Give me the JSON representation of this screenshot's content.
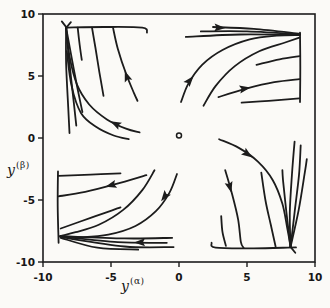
{
  "colors": {
    "ink": "#1c1c1c",
    "background": "#fbfaf7"
  },
  "axis_labels": {
    "x_base": "y",
    "x_sup": "(α)",
    "y_base": "y",
    "y_sup": "(β)"
  },
  "chart_data": {
    "type": "line",
    "subtype": "phase-portrait",
    "title": "",
    "xlabel": "y^(α)",
    "ylabel": "y^(β)",
    "xlabel_base": "y",
    "xlabel_sup": "(α)",
    "ylabel_base": "y",
    "ylabel_sup": "(β)",
    "xlim": [
      -10,
      10
    ],
    "ylim": [
      -10,
      10
    ],
    "grid": false,
    "x_ticks": [
      -10,
      -5,
      0,
      5,
      10
    ],
    "y_ticks": [
      10,
      5,
      0,
      -5,
      -10
    ],
    "x_tick_labels": [
      "-10",
      "-5",
      "0",
      "5",
      "10"
    ],
    "y_tick_labels": [
      "10",
      "5",
      "0",
      "-5",
      "-10"
    ],
    "equilibrium_marker": {
      "x": 0,
      "y": 0.2,
      "symbol": "open-circle"
    },
    "attractors": [
      [
        -8.3,
        8.9
      ],
      [
        8.9,
        8.3
      ],
      [
        -8.75,
        -7.9
      ],
      [
        8.2,
        -8.8
      ]
    ],
    "series": [
      {
        "name": "tl-top-line",
        "points": [
          [
            -8.3,
            8.9
          ],
          [
            -5.5,
            8.95
          ],
          [
            -2.7,
            8.9
          ],
          [
            -2.35,
            8.5
          ]
        ]
      },
      {
        "name": "tl-vertical-1",
        "points": [
          [
            -8.3,
            8.9
          ],
          [
            -8.3,
            6.0
          ],
          [
            -8.15,
            2.5
          ],
          [
            -8.05,
            0.4
          ]
        ]
      },
      {
        "name": "tl-vertical-2",
        "points": [
          [
            -8.3,
            8.9
          ],
          [
            -8.1,
            6.5
          ],
          [
            -7.8,
            3.5
          ],
          [
            -7.55,
            1.0
          ]
        ]
      },
      {
        "name": "tl-vertical-3",
        "points": [
          [
            -8.3,
            8.9
          ],
          [
            -7.95,
            6.8
          ],
          [
            -7.5,
            4.2
          ],
          [
            -7.1,
            2.1
          ]
        ]
      },
      {
        "name": "tl-sweep",
        "points": [
          [
            -8.3,
            8.9
          ],
          [
            -8.05,
            6.6
          ],
          [
            -7.5,
            4.3
          ],
          [
            -6.6,
            2.7
          ],
          [
            -5.3,
            1.5
          ],
          [
            -3.9,
            0.75
          ],
          [
            -2.9,
            0.45
          ]
        ]
      },
      {
        "name": "tl-sweep-low",
        "points": [
          [
            -8.25,
            7.0
          ],
          [
            -7.9,
            4.2
          ],
          [
            -7.2,
            2.0
          ],
          [
            -6.1,
            0.9
          ],
          [
            -4.8,
            0.2
          ],
          [
            -3.7,
            -0.1
          ]
        ]
      },
      {
        "name": "tl-drape-1",
        "points": [
          [
            -7.45,
            8.9
          ],
          [
            -7.3,
            7.5
          ],
          [
            -7.15,
            6.3
          ]
        ]
      },
      {
        "name": "tl-drape-2",
        "points": [
          [
            -6.4,
            8.9
          ],
          [
            -6.15,
            7.3
          ],
          [
            -5.85,
            5.3
          ],
          [
            -5.55,
            3.4
          ]
        ]
      },
      {
        "name": "tl-drape-3",
        "points": [
          [
            -4.85,
            8.9
          ],
          [
            -4.5,
            7.2
          ],
          [
            -3.9,
            5.2
          ],
          [
            -3.3,
            3.6
          ],
          [
            -3.05,
            3.0
          ]
        ]
      },
      {
        "name": "tl-flare-1",
        "points": [
          [
            -8.62,
            9.4
          ],
          [
            -8.25,
            8.88
          ]
        ]
      },
      {
        "name": "tl-flare-2",
        "points": [
          [
            -7.95,
            9.35
          ],
          [
            -8.3,
            8.88
          ]
        ]
      },
      {
        "name": "tr-vertical-line",
        "points": [
          [
            8.9,
            8.5
          ],
          [
            8.92,
            5.7
          ],
          [
            8.9,
            2.9
          ]
        ]
      },
      {
        "name": "tr-bundle-1",
        "points": [
          [
            2.5,
            8.95
          ],
          [
            5.5,
            8.8
          ],
          [
            8.9,
            8.4
          ]
        ]
      },
      {
        "name": "tr-bundle-2",
        "points": [
          [
            1.6,
            8.6
          ],
          [
            5.0,
            8.6
          ],
          [
            8.9,
            8.35
          ]
        ]
      },
      {
        "name": "tr-bundle-3",
        "points": [
          [
            0.5,
            8.15
          ],
          [
            4.5,
            8.35
          ],
          [
            8.85,
            8.3
          ]
        ]
      },
      {
        "name": "tr-sweep-1",
        "points": [
          [
            0.15,
            2.9
          ],
          [
            0.7,
            4.4
          ],
          [
            1.7,
            5.9
          ],
          [
            3.2,
            7.1
          ],
          [
            5.2,
            7.95
          ],
          [
            7.2,
            8.25
          ],
          [
            8.85,
            8.3
          ]
        ]
      },
      {
        "name": "tr-sweep-2",
        "points": [
          [
            1.8,
            2.6
          ],
          [
            2.7,
            4.2
          ],
          [
            4.1,
            5.8
          ],
          [
            5.9,
            7.0
          ],
          [
            7.8,
            7.7
          ],
          [
            8.85,
            8.1
          ]
        ]
      },
      {
        "name": "tr-mid-curve",
        "points": [
          [
            2.9,
            3.3
          ],
          [
            5.0,
            4.0
          ],
          [
            7.0,
            4.5
          ],
          [
            8.85,
            4.75
          ]
        ]
      },
      {
        "name": "tr-low-curve",
        "points": [
          [
            4.6,
            2.85
          ],
          [
            6.6,
            3.0
          ],
          [
            8.85,
            3.2
          ]
        ]
      },
      {
        "name": "tr-upper-curve",
        "points": [
          [
            5.7,
            5.9
          ],
          [
            7.4,
            6.35
          ],
          [
            8.85,
            6.6
          ]
        ]
      },
      {
        "name": "bl-vertical-line",
        "points": [
          [
            -8.9,
            -2.7
          ],
          [
            -8.92,
            -5.5
          ],
          [
            -8.85,
            -8.45
          ]
        ]
      },
      {
        "name": "bl-bundle-1",
        "points": [
          [
            -0.5,
            -8.05
          ],
          [
            -4.0,
            -8.1
          ],
          [
            -8.75,
            -7.9
          ]
        ]
      },
      {
        "name": "bl-bundle-2",
        "points": [
          [
            -0.9,
            -8.45
          ],
          [
            -4.5,
            -8.4
          ],
          [
            -8.75,
            -7.95
          ]
        ]
      },
      {
        "name": "bl-bundle-3",
        "points": [
          [
            -0.4,
            -8.8
          ],
          [
            -4.0,
            -8.75
          ],
          [
            -8.7,
            -8.0
          ]
        ]
      },
      {
        "name": "bl-bundle-4",
        "points": [
          [
            -3.0,
            -9.0
          ],
          [
            -6.0,
            -8.85
          ],
          [
            -8.7,
            -8.05
          ]
        ]
      },
      {
        "name": "bl-sweep-1",
        "points": [
          [
            -0.15,
            -2.9
          ],
          [
            -0.7,
            -4.4
          ],
          [
            -1.7,
            -5.9
          ],
          [
            -3.2,
            -7.1
          ],
          [
            -5.2,
            -7.8
          ],
          [
            -7.0,
            -8.0
          ],
          [
            -8.7,
            -7.95
          ]
        ]
      },
      {
        "name": "bl-sweep-2",
        "points": [
          [
            -1.8,
            -2.6
          ],
          [
            -2.7,
            -4.2
          ],
          [
            -4.1,
            -5.8
          ],
          [
            -5.9,
            -7.0
          ],
          [
            -7.6,
            -7.6
          ],
          [
            -8.7,
            -7.9
          ]
        ]
      },
      {
        "name": "bl-mid-curve",
        "points": [
          [
            -2.4,
            -3.0
          ],
          [
            -4.6,
            -3.7
          ],
          [
            -6.9,
            -4.35
          ],
          [
            -8.85,
            -4.7
          ]
        ]
      },
      {
        "name": "bl-top-curve",
        "points": [
          [
            -4.3,
            -2.85
          ],
          [
            -6.5,
            -2.95
          ],
          [
            -8.85,
            -3.05
          ]
        ]
      },
      {
        "name": "bl-diag-curve",
        "points": [
          [
            -4.3,
            -5.6
          ],
          [
            -6.4,
            -6.4
          ],
          [
            -8.7,
            -7.3
          ]
        ]
      },
      {
        "name": "br-bottom-line",
        "points": [
          [
            2.4,
            -8.45
          ],
          [
            2.7,
            -8.85
          ],
          [
            5.5,
            -8.9
          ],
          [
            8.6,
            -8.82
          ]
        ]
      },
      {
        "name": "br-reed-1",
        "points": [
          [
            8.2,
            -8.8
          ],
          [
            8.15,
            -6.0
          ],
          [
            8.3,
            -3.0
          ],
          [
            8.5,
            -0.3
          ]
        ]
      },
      {
        "name": "br-reed-2",
        "points": [
          [
            8.2,
            -8.8
          ],
          [
            8.5,
            -6.0
          ],
          [
            8.82,
            -3.0
          ],
          [
            8.95,
            -0.6
          ]
        ]
      },
      {
        "name": "br-reed-3",
        "points": [
          [
            8.2,
            -8.8
          ],
          [
            8.8,
            -5.8
          ],
          [
            9.25,
            -2.8
          ],
          [
            9.4,
            -1.7
          ]
        ]
      },
      {
        "name": "br-reed-4",
        "points": [
          [
            8.2,
            -8.8
          ],
          [
            7.9,
            -6.0
          ],
          [
            7.65,
            -3.4
          ],
          [
            7.6,
            -2.6
          ]
        ]
      },
      {
        "name": "br-sweep",
        "points": [
          [
            2.95,
            -0.1
          ],
          [
            4.4,
            -0.8
          ],
          [
            5.8,
            -1.9
          ],
          [
            6.9,
            -3.4
          ],
          [
            7.6,
            -5.3
          ],
          [
            7.95,
            -7.2
          ],
          [
            8.2,
            -8.75
          ]
        ]
      },
      {
        "name": "br-steep",
        "points": [
          [
            3.4,
            -2.6
          ],
          [
            3.9,
            -4.5
          ],
          [
            4.35,
            -6.6
          ],
          [
            4.55,
            -8.4
          ],
          [
            4.75,
            -8.85
          ]
        ]
      },
      {
        "name": "br-drape",
        "points": [
          [
            6.05,
            -2.8
          ],
          [
            6.35,
            -5.0
          ],
          [
            6.75,
            -7.0
          ],
          [
            7.1,
            -8.75
          ]
        ]
      },
      {
        "name": "br-short",
        "points": [
          [
            3.1,
            -6.3
          ],
          [
            3.2,
            -7.6
          ],
          [
            3.45,
            -8.7
          ]
        ]
      },
      {
        "name": "br-flare",
        "points": [
          [
            8.55,
            -9.25
          ],
          [
            8.2,
            -8.78
          ]
        ]
      }
    ],
    "arrows": [
      {
        "x": -3.95,
        "y": 5.3,
        "angle": 110
      },
      {
        "x": -4.95,
        "y": 1.3,
        "angle": 153
      },
      {
        "x": 3.3,
        "y": 8.87,
        "angle": -3
      },
      {
        "x": 1.0,
        "y": 4.9,
        "angle": 50
      },
      {
        "x": 5.15,
        "y": 4.05,
        "angle": 10
      },
      {
        "x": -5.3,
        "y": -3.9,
        "angle": 196
      },
      {
        "x": -1.25,
        "y": -5.0,
        "angle": 233
      },
      {
        "x": -3.2,
        "y": -8.42,
        "angle": 181
      },
      {
        "x": 5.3,
        "y": -1.5,
        "angle": -35
      },
      {
        "x": 3.82,
        "y": -4.3,
        "angle": -75
      }
    ]
  }
}
